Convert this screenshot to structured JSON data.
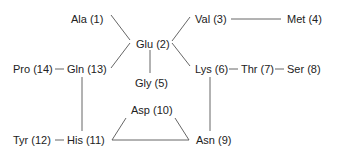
{
  "diagram": {
    "type": "residue-connectivity-graph",
    "nodes": [
      {
        "id": "n1",
        "label": "Ala (1)",
        "x": 71,
        "y": 13
      },
      {
        "id": "n2",
        "label": "Glu (2)",
        "x": 136,
        "y": 38
      },
      {
        "id": "n3",
        "label": "Val (3)",
        "x": 195,
        "y": 13
      },
      {
        "id": "n4",
        "label": "Met (4)",
        "x": 287,
        "y": 13
      },
      {
        "id": "n5",
        "label": "Gly (5)",
        "x": 135,
        "y": 77
      },
      {
        "id": "n6",
        "label": "Lys (6)",
        "x": 195,
        "y": 63
      },
      {
        "id": "n7",
        "label": "Thr (7)",
        "x": 241,
        "y": 63
      },
      {
        "id": "n8",
        "label": "Ser (8)",
        "x": 287,
        "y": 63
      },
      {
        "id": "n9",
        "label": "Asn (9)",
        "x": 196,
        "y": 135
      },
      {
        "id": "n10",
        "label": "Asp (10)",
        "x": 131,
        "y": 104
      },
      {
        "id": "n11",
        "label": "His (11)",
        "x": 67,
        "y": 135
      },
      {
        "id": "n12",
        "label": "Tyr (12)",
        "x": 13,
        "y": 135
      },
      {
        "id": "n13",
        "label": "Gln (13)",
        "x": 67,
        "y": 63
      },
      {
        "id": "n14",
        "label": "Pro (14)",
        "x": 13,
        "y": 63
      }
    ],
    "edges": [
      {
        "from": "Ala (1)",
        "to": "Glu (2)"
      },
      {
        "from": "Gln (13)",
        "to": "Glu (2)"
      },
      {
        "from": "Glu (2)",
        "to": "Val (3)"
      },
      {
        "from": "Glu (2)",
        "to": "Lys (6)"
      },
      {
        "from": "Glu (2)",
        "to": "Gly (5)"
      },
      {
        "from": "Val (3)",
        "to": "Met (4)"
      },
      {
        "from": "Lys (6)",
        "to": "Thr (7)"
      },
      {
        "from": "Thr (7)",
        "to": "Ser (8)"
      },
      {
        "from": "Lys (6)",
        "to": "Asn (9)"
      },
      {
        "from": "Pro (14)",
        "to": "Gln (13)"
      },
      {
        "from": "Gln (13)",
        "to": "His (11)"
      },
      {
        "from": "Tyr (12)",
        "to": "His (11)"
      },
      {
        "from": "His (11)",
        "to": "Asp (10)"
      },
      {
        "from": "His (11)",
        "to": "Asn (9)"
      },
      {
        "from": "Asp (10)",
        "to": "Asn (9)"
      }
    ],
    "line_color": "#555555",
    "text_color": "#222222"
  }
}
